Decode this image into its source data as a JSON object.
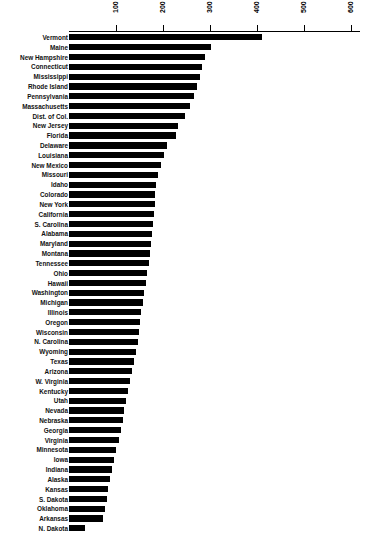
{
  "title": "NATIONAL RANKING BY STATE",
  "axis": {
    "ticks": [
      100,
      200,
      300,
      400,
      500,
      600
    ],
    "min": 0,
    "max": 620,
    "tick_labels": [
      "100",
      "200",
      "300",
      "400",
      "500",
      "600"
    ]
  },
  "chart_data": {
    "type": "bar",
    "orientation": "horizontal",
    "title": "NATIONAL RANKING BY STATE",
    "xlabel": "",
    "ylabel": "",
    "xlim": [
      0,
      620
    ],
    "grid": false,
    "legend": "none",
    "categories": [
      "Vermont",
      "Maine",
      "New Hampshire",
      "Connecticut",
      "Mississippi",
      "Rhode Island",
      "Pennsylvania",
      "Massachusetts",
      "Dist. of Col.",
      "New Jersey",
      "Florida",
      "Delaware",
      "Louisiana",
      "New Mexico",
      "Missouri",
      "Idaho",
      "Colorado",
      "New York",
      "California",
      "S. Carolina",
      "Alabama",
      "Maryland",
      "Montana",
      "Tennessee",
      "Ohio",
      "Hawaii",
      "Washington",
      "Michigan",
      "Illinois",
      "Oregon",
      "Wisconsin",
      "N. Carolina",
      "Wyoming",
      "Texas",
      "Arizona",
      "W. Virginia",
      "Kentucky",
      "Utah",
      "Nevada",
      "Nebraska",
      "Georgia",
      "Virginia",
      "Minnesota",
      "Iowa",
      "Indiana",
      "Alaska",
      "Kansas",
      "S. Dakota",
      "Oklahoma",
      "Arkansas",
      "N. Dakota"
    ],
    "values": [
      410,
      302,
      289,
      282,
      278,
      272,
      265,
      258,
      246,
      232,
      228,
      208,
      202,
      196,
      190,
      186,
      184,
      182,
      180,
      178,
      176,
      174,
      172,
      170,
      166,
      164,
      160,
      158,
      154,
      150,
      148,
      146,
      142,
      138,
      134,
      130,
      126,
      122,
      118,
      114,
      110,
      106,
      100,
      96,
      92,
      88,
      84,
      80,
      76,
      72,
      34
    ]
  }
}
